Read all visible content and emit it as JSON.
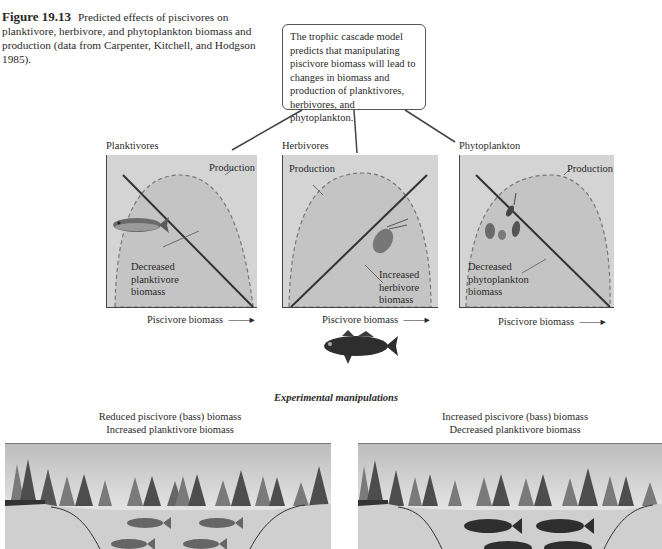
{
  "caption": {
    "figure_number": "Figure 19.13",
    "text": "Predicted effects of piscivores on planktivore, herbivore, and phytoplankton biomass and production (data from Carpenter, Kitchell, and Hodgson 1985)."
  },
  "callout": {
    "text": "The trophic cascade model predicts that manipulating piscivore biomass will lead to changes in biomass and production of planktivores, herbivores, and phytoplankton."
  },
  "panels": [
    {
      "title": "Planktivores",
      "curve_label": "Production",
      "line_label": "Decreased planktivore biomass",
      "x_label": "Piscivore biomass",
      "trend": "decreasing",
      "organism": "planktivore-fish"
    },
    {
      "title": "Herbivores",
      "curve_label": "Production",
      "line_label": "Increased herbivore biomass",
      "x_label": "Piscivore biomass",
      "trend": "increasing",
      "organism": "zooplankton"
    },
    {
      "title": "Phytoplankton",
      "curve_label": "Production",
      "line_label": "Decreased phytoplankton biomass",
      "x_label": "Piscivore biomass",
      "trend": "decreasing",
      "organism": "algae"
    }
  ],
  "experiment": {
    "title": "Experimental manipulations",
    "left": {
      "line1": "Reduced piscivore (bass) biomass",
      "line2": "Increased planktivore biomass",
      "fish": "planktivores"
    },
    "right": {
      "line1": "Increased piscivore (bass) biomass",
      "line2": "Decreased planktivore biomass",
      "fish": "bass"
    }
  },
  "colors": {
    "panel_fill": "#d4d4d4",
    "production_fill": "#c2c2c2",
    "line": "#333333",
    "water": "#cfcfcf",
    "tree_dark": "#4d4d4d",
    "tree_light": "#7a7a7a"
  }
}
